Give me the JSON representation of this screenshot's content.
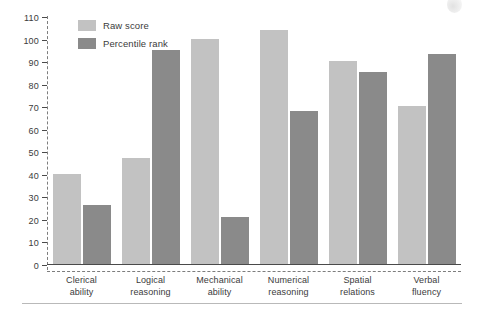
{
  "chart_data": {
    "type": "bar",
    "title": "",
    "subtitle": "",
    "xlabel": "",
    "ylabel": "",
    "ylim": [
      0,
      110
    ],
    "yticks": [
      0,
      10,
      20,
      30,
      40,
      50,
      60,
      70,
      80,
      90,
      100,
      110
    ],
    "grid": false,
    "legend_position": "top-left",
    "categories": [
      "Clerical ability",
      "Logical reasoning",
      "Mechanical ability",
      "Numerical reasoning",
      "Spatial relations",
      "Verbal fluency"
    ],
    "category_lines": [
      [
        "Clerical",
        "ability"
      ],
      [
        "Logical",
        "reasoning"
      ],
      [
        "Mechanical",
        "ability"
      ],
      [
        "Numerical",
        "reasoning"
      ],
      [
        "Spatial",
        "relations"
      ],
      [
        "Verbal",
        "fluency"
      ]
    ],
    "series": [
      {
        "name": "Raw score",
        "color": "#c2c2c2",
        "values": [
          40,
          47,
          100,
          104,
          90,
          70
        ]
      },
      {
        "name": "Percentile rank",
        "color": "#8a8a8a",
        "values": [
          26,
          95,
          21,
          68,
          85,
          93
        ]
      }
    ]
  },
  "legend": {
    "items": [
      {
        "label": "Raw score",
        "color": "#c2c2c2"
      },
      {
        "label": "Percentile rank",
        "color": "#8a8a8a"
      }
    ]
  },
  "axis": {
    "tick_labels": [
      "110",
      "100",
      "90",
      "80",
      "70",
      "60",
      "50",
      "40",
      "30",
      "20",
      "10",
      "0"
    ]
  },
  "colors": {
    "raw_score": "#c2c2c2",
    "percentile_rank": "#8a8a8a",
    "axis": "#4a4a4a",
    "text": "#3b3b3b",
    "rule": "#b9b9b9"
  }
}
